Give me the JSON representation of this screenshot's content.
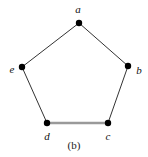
{
  "figure": {
    "caption": "(b)",
    "background_color": "#ffffff",
    "width": 148,
    "height": 157
  },
  "chart_data": {
    "type": "diagram",
    "title": "(b)",
    "graph_kind": "cycle",
    "vertex_count": 5,
    "edge_count": 5,
    "vertices": [
      {
        "id": "a",
        "label": "a",
        "x": 79,
        "y": 23,
        "label_x": 78,
        "label_y": 9,
        "radius": 3.2,
        "color": "#000000"
      },
      {
        "id": "b",
        "label": "b",
        "x": 128,
        "y": 66,
        "label_x": 139,
        "label_y": 70,
        "radius": 3.2,
        "color": "#000000"
      },
      {
        "id": "c",
        "label": "c",
        "x": 108,
        "y": 123,
        "label_x": 108,
        "label_y": 136,
        "radius": 3.2,
        "color": "#000000"
      },
      {
        "id": "d",
        "label": "d",
        "x": 47,
        "y": 123,
        "label_x": 47,
        "label_y": 136,
        "radius": 3.2,
        "color": "#000000"
      },
      {
        "id": "e",
        "label": "e",
        "x": 22,
        "y": 67,
        "label_x": 12,
        "label_y": 69,
        "radius": 3.2,
        "color": "#000000"
      }
    ],
    "edges": [
      {
        "id": "a-b",
        "source": "a",
        "target": "b",
        "color": "#333333",
        "width": 1.0,
        "style": "thin-dark"
      },
      {
        "id": "b-c",
        "source": "b",
        "target": "c",
        "color": "#333333",
        "width": 1.0,
        "style": "thin-dark"
      },
      {
        "id": "c-d",
        "source": "c",
        "target": "d",
        "color": "#9a9a9a",
        "width": 2.4,
        "style": "thick-gray"
      },
      {
        "id": "d-e",
        "source": "d",
        "target": "e",
        "color": "#333333",
        "width": 1.0,
        "style": "thin-dark"
      },
      {
        "id": "e-a",
        "source": "e",
        "target": "a",
        "color": "#333333",
        "width": 1.0,
        "style": "thin-dark"
      }
    ],
    "colors": {
      "vertex": "#000000",
      "edge_default": "#333333",
      "edge_highlight": "#9a9a9a",
      "label": "#111111",
      "background": "#ffffff"
    }
  }
}
